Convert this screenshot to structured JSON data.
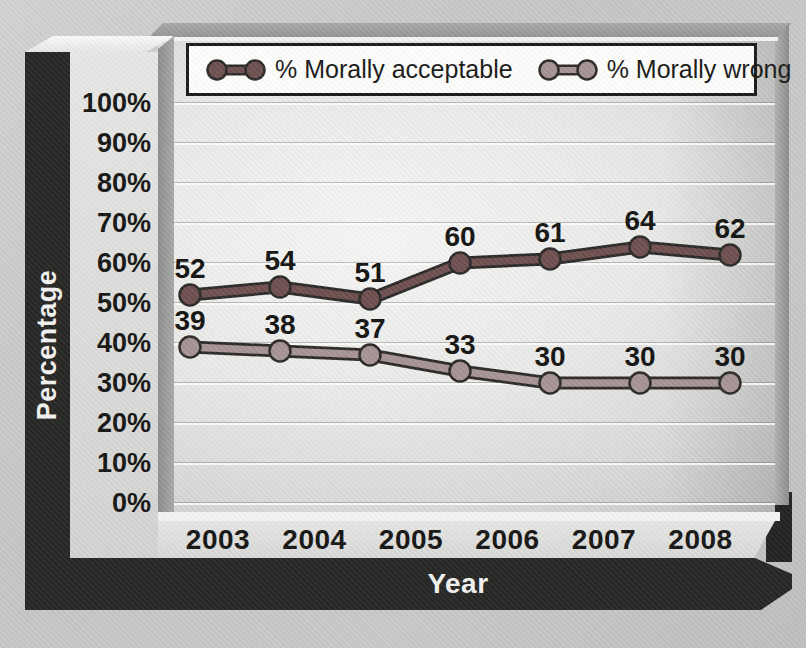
{
  "figure": {
    "ylabel": "Percentage",
    "xlabel": "Year"
  },
  "colors": {
    "series_acceptable": "#6f5050",
    "series_wrong": "#a79494",
    "marker_outline": "#2d2b2a",
    "frame_dark": "#272725",
    "value_label": "#141412"
  },
  "chart_data": {
    "type": "line",
    "title": "",
    "xlabel": "Year",
    "ylabel": "Percentage",
    "x_tick_labels": [
      "2003",
      "2004",
      "2005",
      "2006",
      "2007",
      "2008"
    ],
    "y_tick_labels": [
      "100%",
      "90%",
      "80%",
      "70%",
      "60%",
      "50%",
      "40%",
      "30%",
      "20%",
      "10%",
      "0%"
    ],
    "ylim": [
      0,
      100
    ],
    "grid": "horizontal",
    "legend_position": "top-inside",
    "series": [
      {
        "name": "% Morally acceptable",
        "color": "#6f5050",
        "values": [
          52,
          54,
          51,
          60,
          61,
          64,
          62
        ],
        "point_labels": [
          "52",
          "54",
          "51",
          "60",
          "61",
          "64",
          "62"
        ]
      },
      {
        "name": "% Morally wrong",
        "color": "#a79494",
        "values": [
          39,
          38,
          37,
          33,
          30,
          30,
          30
        ],
        "point_labels": [
          "39",
          "38",
          "37",
          "33",
          "30",
          "30",
          "30"
        ]
      }
    ]
  }
}
